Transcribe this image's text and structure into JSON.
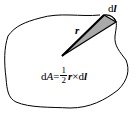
{
  "diagram": {
    "labels": {
      "dl_label": "dl",
      "dl_d": "d",
      "dl_l": "l",
      "r_label": "r",
      "formula": {
        "lhs_d": "d",
        "lhs_A": "A",
        "equals": "=",
        "frac_num": "1",
        "frac_den": "2",
        "r": "r",
        "times": "×",
        "d": "d",
        "l": "l"
      }
    },
    "colors": {
      "outline": "#000000",
      "sector_fill": "#a9a9a9",
      "background": "#ffffff"
    }
  }
}
